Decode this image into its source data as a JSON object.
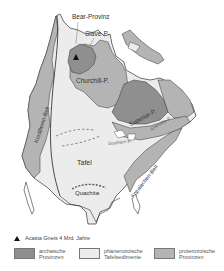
{
  "map": {
    "labels": {
      "bear": "Bear-Provinz",
      "slave": "Slave-P.",
      "churchill": "Churchill-P.",
      "superior": "Superior-P.",
      "grenville": "Grenville-P.",
      "southern": "Southern-P.",
      "kordilleren": "Kordilleren-Belt",
      "tafel": "Tafel",
      "quachita": "Quachita",
      "appalachen": "Appalachen-Belt"
    },
    "colors": {
      "archaic": "#8f8f8f",
      "phanerozoic": "#ececec",
      "proterozoic": "#b4b4b4",
      "outline": "#333333"
    }
  },
  "legend": {
    "marker_note": "Acasta Gneis 4 Mrd. Jahre",
    "items": [
      {
        "label_line1": "archaische",
        "label_line2": "Provinzen",
        "color": "#8f8f8f"
      },
      {
        "label_line1": "phanerozoische",
        "label_line2": "Tafelsedimente",
        "color": "#ececec"
      },
      {
        "label_line1": "proterozoische",
        "label_line2": "Provinzen",
        "color": "#b4b4b4"
      }
    ]
  }
}
